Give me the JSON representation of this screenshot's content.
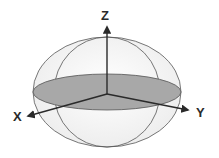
{
  "diagram": {
    "type": "3d-coordinate-axes-with-ellipsoid",
    "axes": {
      "z": {
        "label": "Z"
      },
      "x": {
        "label": "X"
      },
      "y": {
        "label": "Y"
      }
    },
    "colors": {
      "stroke": "#555555",
      "axis": "#2a2a2a",
      "equatorial_disk": "#a8a8a8",
      "sphere_fill": "#f4f4f4"
    }
  }
}
